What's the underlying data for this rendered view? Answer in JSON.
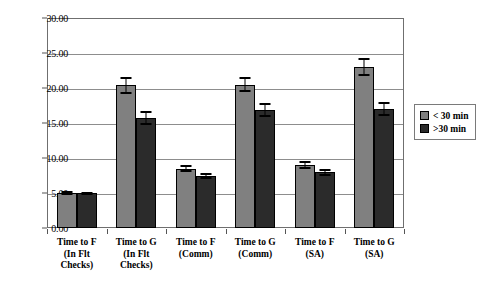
{
  "chart_data": {
    "type": "bar",
    "title": "",
    "xlabel": "",
    "ylabel": "",
    "ylim": [
      0,
      30
    ],
    "ytick_step": 5,
    "grid": true,
    "legend_position": "right",
    "ytick_labels": [
      "0.00",
      "5.00",
      "10.00",
      "15.00",
      "20.00",
      "25.00",
      "30.00"
    ],
    "ytick_values": [
      0,
      5,
      10,
      15,
      20,
      25,
      30
    ],
    "categories": [
      "Time to F\n(In Flt\nChecks)",
      "Time to G\n(In Flt\nChecks)",
      "Time to F\n(Comm)",
      "Time to G\n(Comm)",
      "Time to F\n(SA)",
      "Time to G\n(SA)"
    ],
    "series": [
      {
        "name": "< 30 min",
        "color": "#808080",
        "values": [
          5.0,
          20.4,
          8.5,
          20.5,
          9.0,
          23.0
        ],
        "errors": [
          0.3,
          1.2,
          0.5,
          1.1,
          0.6,
          1.3
        ]
      },
      {
        "name": ">30 min",
        "color": "#2b2b2b",
        "values": [
          4.95,
          15.7,
          7.4,
          16.9,
          8.0,
          17.0
        ],
        "errors": [
          0.25,
          1.0,
          0.4,
          1.0,
          0.5,
          1.0
        ]
      }
    ]
  },
  "legend": {
    "items": [
      {
        "label": "< 30 min",
        "swatch": "light"
      },
      {
        "label": ">30 min",
        "swatch": "dark"
      }
    ]
  }
}
